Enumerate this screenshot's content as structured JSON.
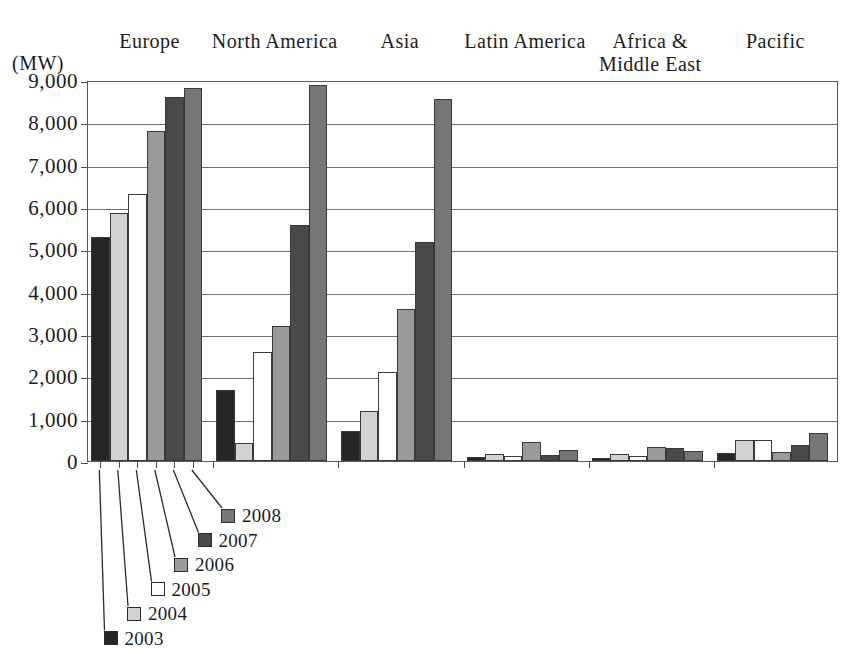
{
  "chart_data": {
    "type": "bar",
    "title": "",
    "subtitle": "",
    "xlabel": "",
    "ylabel": "(MW)",
    "unit_label": "(MW)",
    "ylim": [
      0,
      9000
    ],
    "ytick_labels": [
      "9,000",
      "8,000",
      "7,000",
      "6,000",
      "5,000",
      "4,000",
      "3,000",
      "2,000",
      "1,000",
      "0"
    ],
    "ytick_values": [
      9000,
      8000,
      7000,
      6000,
      5000,
      4000,
      3000,
      2000,
      1000,
      0
    ],
    "grid": true,
    "legend_position": "below-left-staircase",
    "categories": [
      "Europe",
      "North America",
      "Asia",
      "Latin America",
      "Africa &\nMiddle East",
      "Pacific"
    ],
    "series": [
      {
        "name": "2003",
        "color": "#262626",
        "values": [
          5300,
          1670,
          700,
          100,
          70,
          200
        ]
      },
      {
        "name": "2004",
        "color": "#d2d2d2",
        "values": [
          5850,
          420,
          1180,
          170,
          160,
          500
        ]
      },
      {
        "name": "2005",
        "color": "#ffffff",
        "values": [
          6300,
          2580,
          2100,
          120,
          130,
          500
        ]
      },
      {
        "name": "2006",
        "color": "#9a9a9a",
        "values": [
          7800,
          3180,
          3600,
          450,
          330,
          220
        ]
      },
      {
        "name": "2007",
        "color": "#4a4a4a",
        "values": [
          8600,
          5580,
          5180,
          140,
          310,
          380
        ]
      },
      {
        "name": "2008",
        "color": "#767676",
        "values": [
          8800,
          8880,
          8560,
          270,
          230,
          660
        ]
      }
    ]
  },
  "legend": {
    "entries": [
      {
        "label": "2008",
        "color": "#767676"
      },
      {
        "label": "2007",
        "color": "#4a4a4a"
      },
      {
        "label": "2006",
        "color": "#9a9a9a"
      },
      {
        "label": "2005",
        "color": "#ffffff"
      },
      {
        "label": "2004",
        "color": "#d2d2d2"
      },
      {
        "label": "2003",
        "color": "#262626"
      }
    ]
  },
  "colors": {
    "axis": "#5a5a5a",
    "grid": "#6f6f6f",
    "text": "#1c1c1c",
    "background": "#ffffff"
  }
}
